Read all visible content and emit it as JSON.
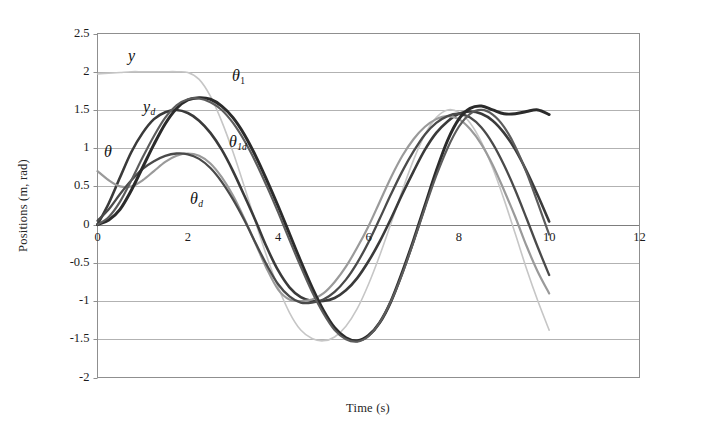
{
  "chart_data": {
    "type": "line",
    "title": "",
    "xlabel": "Time (s)",
    "ylabel": "Positions (m, rad)",
    "xlim": [
      0,
      12
    ],
    "ylim": [
      -2,
      2.5
    ],
    "xticks": [
      "0",
      "2",
      "4",
      "6",
      "8",
      "10",
      "12"
    ],
    "yticks": [
      "2.5",
      "2",
      "1.5",
      "1",
      "0.5",
      "0",
      "-0.5",
      "-1",
      "-1.5",
      "-2"
    ],
    "xtick_values": [
      0,
      2,
      4,
      6,
      8,
      10,
      12
    ],
    "ytick_values": [
      2.5,
      2,
      1.5,
      1,
      0.5,
      0,
      -0.5,
      -1,
      -1.5,
      -2
    ],
    "grid": "horizontal",
    "legend": "inline-annotations",
    "x": [
      0,
      0.25,
      0.5,
      0.75,
      1,
      1.25,
      1.5,
      1.75,
      2,
      2.25,
      2.5,
      2.75,
      3,
      3.25,
      3.5,
      3.75,
      4,
      4.25,
      4.5,
      4.75,
      5,
      5.25,
      5.5,
      5.75,
      6,
      6.25,
      6.5,
      6.75,
      7,
      7.25,
      7.5,
      7.75,
      8,
      8.25,
      8.5,
      8.75,
      9,
      9.25,
      9.5,
      9.75,
      10
    ],
    "series": [
      {
        "name": "y",
        "label": "y",
        "color": "#c6c6c6",
        "width": 1.6,
        "values": [
          1.97,
          1.98,
          1.99,
          2.0,
          2.0,
          2.0,
          2.0,
          2.0,
          1.99,
          1.9,
          1.68,
          1.35,
          0.95,
          0.5,
          0.03,
          -0.42,
          -0.82,
          -1.15,
          -1.38,
          -1.49,
          -1.52,
          -1.47,
          -1.33,
          -1.1,
          -0.78,
          -0.4,
          0.02,
          0.45,
          0.85,
          1.18,
          1.4,
          1.5,
          1.47,
          1.33,
          1.08,
          0.74,
          0.33,
          -0.12,
          -0.58,
          -1.0,
          -1.38
        ]
      },
      {
        "name": "y_d",
        "label": "y_d",
        "color": "#3a3a3a",
        "width": 2.6,
        "values": [
          0.0,
          0.28,
          0.62,
          0.95,
          1.2,
          1.38,
          1.47,
          1.5,
          1.46,
          1.36,
          1.2,
          0.98,
          0.7,
          0.38,
          0.05,
          -0.3,
          -0.6,
          -0.82,
          -0.95,
          -1.0,
          -1.0,
          -0.96,
          -0.86,
          -0.7,
          -0.48,
          -0.22,
          0.08,
          0.4,
          0.7,
          0.98,
          1.2,
          1.35,
          1.45,
          1.48,
          1.45,
          1.36,
          1.2,
          0.98,
          0.7,
          0.38,
          0.04
        ]
      },
      {
        "name": "theta",
        "label": "θ",
        "color": "#9a9a9a",
        "width": 2.2,
        "values": [
          0.7,
          0.58,
          0.5,
          0.5,
          0.58,
          0.7,
          0.82,
          0.9,
          0.93,
          0.9,
          0.8,
          0.62,
          0.38,
          0.08,
          -0.25,
          -0.58,
          -0.85,
          -0.98,
          -1.0,
          -0.98,
          -0.9,
          -0.75,
          -0.55,
          -0.3,
          -0.02,
          0.3,
          0.62,
          0.9,
          1.12,
          1.28,
          1.38,
          1.42,
          1.38,
          1.25,
          1.05,
          0.78,
          0.45,
          0.1,
          -0.28,
          -0.62,
          -0.9
        ]
      },
      {
        "name": "theta_d",
        "label": "θ_d",
        "color": "#4a4a4a",
        "width": 2.3,
        "values": [
          0.05,
          0.2,
          0.4,
          0.58,
          0.73,
          0.83,
          0.9,
          0.93,
          0.92,
          0.86,
          0.74,
          0.56,
          0.33,
          0.06,
          -0.24,
          -0.53,
          -0.78,
          -0.94,
          -1.02,
          -1.02,
          -0.98,
          -0.88,
          -0.72,
          -0.5,
          -0.23,
          0.08,
          0.4,
          0.7,
          0.96,
          1.18,
          1.33,
          1.42,
          1.45,
          1.4,
          1.27,
          1.06,
          0.78,
          0.45,
          0.08,
          -0.3,
          -0.66
        ]
      },
      {
        "name": "theta_1",
        "label": "θ₁",
        "color": "#2b2b2b",
        "width": 3.0,
        "values": [
          0.0,
          0.06,
          0.2,
          0.45,
          0.75,
          1.05,
          1.32,
          1.52,
          1.63,
          1.66,
          1.64,
          1.55,
          1.4,
          1.18,
          0.9,
          0.58,
          0.24,
          -0.12,
          -0.48,
          -0.82,
          -1.12,
          -1.35,
          -1.48,
          -1.52,
          -1.45,
          -1.28,
          -1.0,
          -0.62,
          -0.2,
          0.25,
          0.7,
          1.1,
          1.38,
          1.52,
          1.55,
          1.5,
          1.45,
          1.45,
          1.48,
          1.5,
          1.44
        ]
      },
      {
        "name": "theta_1d",
        "label": "θ₁d",
        "color": "#5c5c5c",
        "width": 2.2,
        "values": [
          0.0,
          0.1,
          0.3,
          0.58,
          0.88,
          1.16,
          1.4,
          1.56,
          1.64,
          1.65,
          1.6,
          1.5,
          1.33,
          1.1,
          0.82,
          0.5,
          0.16,
          -0.2,
          -0.55,
          -0.88,
          -1.16,
          -1.38,
          -1.5,
          -1.53,
          -1.46,
          -1.28,
          -1.0,
          -0.64,
          -0.22,
          0.22,
          0.64,
          1.0,
          1.28,
          1.45,
          1.5,
          1.44,
          1.28,
          1.02,
          0.68,
          0.28,
          -0.13
        ]
      }
    ],
    "annotations": [
      {
        "text": "y",
        "sub": "",
        "x_px": 128,
        "y_px": 48
      },
      {
        "text": "y",
        "sub": "d",
        "x_px": 143,
        "y_px": 99
      },
      {
        "text": "θ",
        "sub": "",
        "x_px": 104,
        "y_px": 144
      },
      {
        "text": "θ",
        "sub": "d",
        "x_px": 190,
        "y_px": 191
      },
      {
        "text": "θ",
        "sub": "1",
        "x_px": 232,
        "y_px": 68
      },
      {
        "text": "θ",
        "sub": "1d",
        "x_px": 229,
        "y_px": 134
      }
    ]
  }
}
